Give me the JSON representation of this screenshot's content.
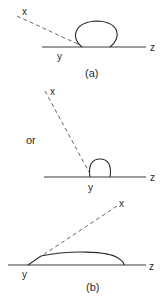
{
  "figure": {
    "panels": [
      {
        "id": "a",
        "caption": "(a)",
        "labels": {
          "x": "x",
          "y": "y",
          "z": "z"
        },
        "description": "Large spherical drop on surface; dashed tangent line x-y at obtuse contact angle"
      },
      {
        "id": "or",
        "connector": "or",
        "labels": {
          "x": "x",
          "y": "y",
          "z": "z"
        },
        "description": "Small hemispherical drop with steep dashed tangent x-y"
      },
      {
        "id": "b",
        "caption": "(b)",
        "labels": {
          "x": "x",
          "y": "y",
          "z": "z"
        },
        "description": "Flat spreading drop with low contact angle; dashed tangent x-y"
      }
    ],
    "colors": {
      "ink": "#2a2a2a",
      "dash": "#555555",
      "background": "#ffffff"
    }
  }
}
